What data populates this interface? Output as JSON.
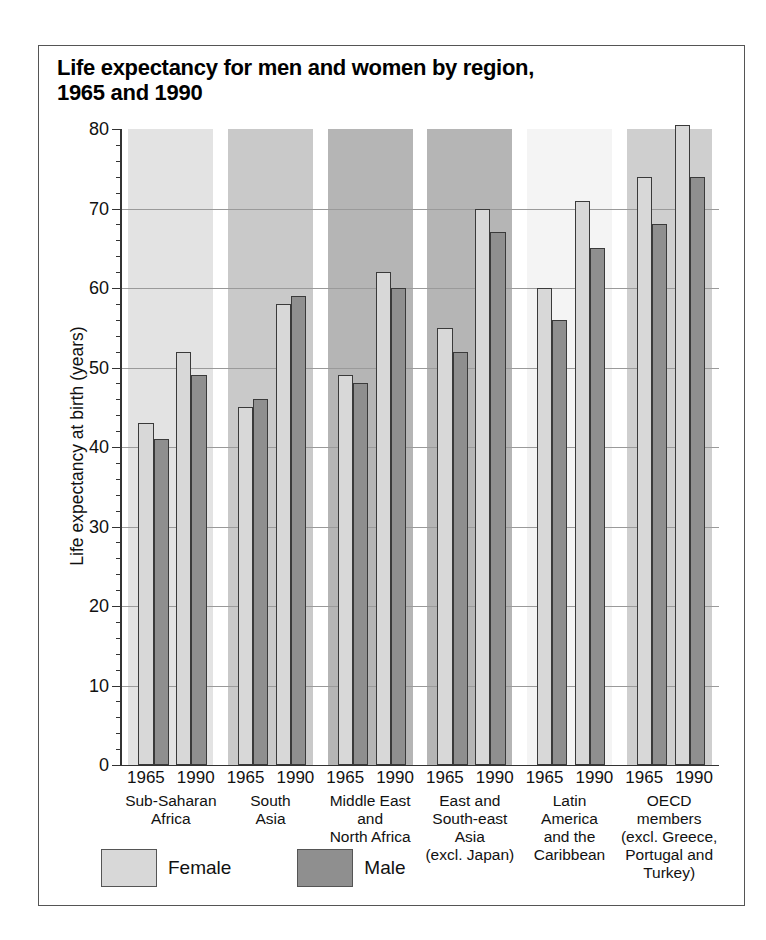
{
  "chart_data": {
    "type": "bar",
    "title": "Life expectancy for men and women by region,\n1965 and 1990",
    "xlabel": "",
    "ylabel": "Life expectancy at birth (years)",
    "ylim": [
      0,
      80
    ],
    "ytick_step": 10,
    "yminor_step": 2,
    "ytick_labels": [
      "0",
      "10",
      "20",
      "30",
      "40",
      "50",
      "60",
      "70",
      "80"
    ],
    "grid": "horizontal",
    "legend_position": "bottom-left",
    "legend": [
      {
        "label": "Female",
        "color": "#d8d8d8"
      },
      {
        "label": "Male",
        "color": "#8f8f8f"
      }
    ],
    "years": [
      "1965",
      "1990"
    ],
    "categories": [
      "Sub-Saharan\nAfrica",
      "South\nAsia",
      "Middle East\nand\nNorth Africa",
      "East and\nSouth-east Asia\n(excl. Japan)",
      "Latin\nAmerica\nand the\nCaribbean",
      "OECD members\n(excl. Greece,\nPortugal and\nTurkey)"
    ],
    "series": [
      {
        "name": "Female 1965",
        "values": [
          43,
          45,
          49,
          55,
          60,
          74
        ]
      },
      {
        "name": "Male 1965",
        "values": [
          41,
          46,
          48,
          52,
          56,
          68
        ]
      },
      {
        "name": "Female 1990",
        "values": [
          52,
          58,
          62,
          70,
          71,
          80.5
        ]
      },
      {
        "name": "Male 1990",
        "values": [
          49,
          59,
          60,
          67,
          65,
          74
        ]
      }
    ],
    "band_colors": [
      "#e3e3e3",
      "#c9c9c9",
      "#b5b5b5",
      "#b5b5b5",
      "#f4f4f4",
      "#cfcfcf"
    ]
  }
}
